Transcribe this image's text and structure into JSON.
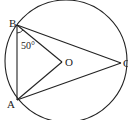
{
  "diagram": {
    "type": "circle-geometry",
    "points": {
      "B": {
        "label": "B",
        "x": 17,
        "y": 25
      },
      "A": {
        "label": "A",
        "x": 17,
        "y": 100
      },
      "O": {
        "label": "O",
        "x": 62,
        "y": 62
      },
      "C": {
        "label": "C",
        "x": 121,
        "y": 63
      }
    },
    "circle": {
      "cx": 66,
      "cy": 61,
      "r": 61
    },
    "angle_label": "50°",
    "segments": [
      "BA",
      "BC",
      "AC",
      "BO",
      "AO"
    ]
  }
}
